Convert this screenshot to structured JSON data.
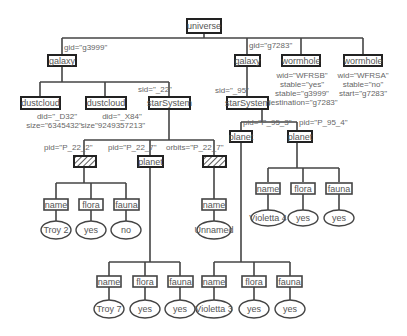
{
  "root": {
    "label": "universe"
  },
  "galaxy_left": {
    "label": "galaxy",
    "attr": "gid=\"g3999\""
  },
  "galaxy_right": {
    "label": "galaxy",
    "attr": "gid=\"g7283\""
  },
  "wormhole_1": {
    "label": "wormhole",
    "attrs": [
      "wid=\"WFRSB\"",
      "stable=\"yes\"",
      "stable=\"g3999\"",
      "destination=\"g7283\""
    ]
  },
  "wormhole_2": {
    "label": "wormhole",
    "attrs": [
      "wid=\"WFRSA\"",
      "stable=\"no\"",
      "start=\"g7283\""
    ]
  },
  "dustcloud_1": {
    "label": "dustcloud",
    "attrs": [
      "did=\"_D32\"",
      "size=\"6345432\""
    ]
  },
  "dustcloud_2": {
    "label": "dustcloud",
    "attrs": [
      "did=\"_X84\"",
      "size\"9249357213\""
    ]
  },
  "starsystem_left": {
    "label": "starSystem",
    "attr": "sid=\"_22\""
  },
  "starsystem_right": {
    "label": "starSystem",
    "attr": "sid=\"_95\""
  },
  "planet_hatched": {
    "label": "planet",
    "attr": "pid=\"P_22_2\""
  },
  "planet_22_7": {
    "label": "planet",
    "attr": "pid=\"P_22_7\""
  },
  "moon_hatched": {
    "label": "moon",
    "attr": "orbits=\"P_22_7\""
  },
  "planet_95_3": {
    "label": "planet",
    "attr": "pid=\"P_95_3\""
  },
  "planet_95_4": {
    "label": "planet",
    "attr": "pid=\"P_95_4\""
  },
  "p22_2_children": [
    {
      "label": "name",
      "value": "Troy 2"
    },
    {
      "label": "flora",
      "value": "yes"
    },
    {
      "label": "fauna",
      "value": "no"
    }
  ],
  "moon_children": [
    {
      "label": "name",
      "value": "Unnamed"
    }
  ],
  "p95_4_children": [
    {
      "label": "name",
      "value": "Violetta 4"
    },
    {
      "label": "flora",
      "value": "yes"
    },
    {
      "label": "fauna",
      "value": "yes"
    }
  ],
  "p22_7_children": [
    {
      "label": "name",
      "value": "Troy 7"
    },
    {
      "label": "flora",
      "value": "yes"
    },
    {
      "label": "fauna",
      "value": "yes"
    }
  ],
  "p95_3_children": [
    {
      "label": "name",
      "value": "Violetta 3"
    },
    {
      "label": "flora",
      "value": "yes"
    },
    {
      "label": "fauna",
      "value": "yes"
    }
  ]
}
